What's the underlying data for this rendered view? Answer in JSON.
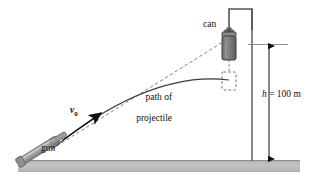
{
  "diagram": {
    "labels": {
      "can": "can",
      "path_line1": "path of",
      "path_line2": "projectile",
      "gun": "gun",
      "v0_symbol": "v",
      "v0_subscript": "0",
      "height_symbol": "h",
      "height_equals": " = 100 m"
    },
    "colors": {
      "ink": "#3a3a3a",
      "ink_dark": "#111111",
      "ground_fill": "#b9b9b9",
      "ground_edge": "#8e8e8e",
      "can_fill": "#7c7c7c",
      "can_edge": "#3c3c3c",
      "gun_fill": "#a8a8a8",
      "gun_edge": "#6b6b6b",
      "pole": "#555555",
      "dash": "#6f6f6f"
    },
    "values": {
      "height_m": 100
    },
    "elements": {
      "ground": "ground-strip",
      "aim_line": "dashed-line-of-sight",
      "trajectory": "parabolic-path",
      "can_initial": "suspended-can",
      "can_fallen": "dashed-fallen-can-outline",
      "drop_line": "dashed-vertical-drop-line",
      "support": "overhead-support-bracket",
      "pole": "vertical-pole",
      "dimension": "height-dimension-arrow",
      "gun": "gun-barrel",
      "velocity_vector": "initial-velocity-arrow"
    }
  }
}
